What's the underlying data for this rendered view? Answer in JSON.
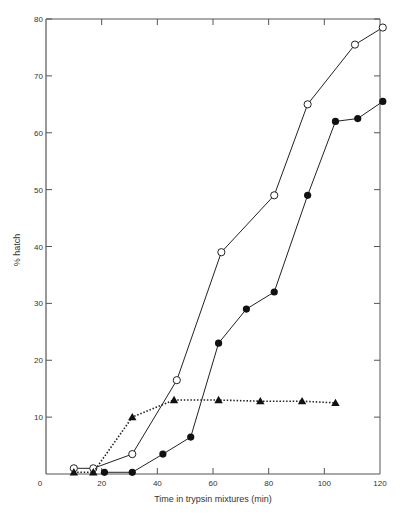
{
  "chart_data": {
    "type": "line",
    "title": "",
    "xlabel": "Time in trypsin mixtures (min)",
    "ylabel": "% hatch",
    "xlim": [
      0,
      120
    ],
    "ylim": [
      0,
      80
    ],
    "x_ticks": [
      0,
      20,
      40,
      60,
      80,
      100,
      120
    ],
    "y_ticks": [
      10,
      20,
      30,
      40,
      50,
      60,
      70,
      80
    ],
    "grid": false,
    "legend": "none",
    "series": [
      {
        "name": "open circles",
        "marker": "open-circle",
        "line": "solid",
        "x": [
          10,
          17,
          31,
          47,
          63,
          82,
          94,
          111,
          121
        ],
        "y": [
          1,
          1,
          3.5,
          16.5,
          39,
          49,
          65,
          75.5,
          78.5
        ]
      },
      {
        "name": "filled circles",
        "marker": "filled-circle",
        "line": "solid",
        "x": [
          21,
          31,
          42,
          52,
          62,
          72,
          82,
          94,
          104,
          112,
          121
        ],
        "y": [
          0.3,
          0.3,
          3.5,
          6.5,
          23,
          29,
          32,
          49,
          62,
          62.5,
          65.5
        ]
      },
      {
        "name": "filled triangles",
        "marker": "filled-triangle",
        "line": "dotted",
        "x": [
          10,
          17,
          31,
          46,
          62,
          77,
          92,
          104
        ],
        "y": [
          0.3,
          0.3,
          10,
          13,
          13,
          12.8,
          12.8,
          12.5
        ]
      }
    ]
  }
}
